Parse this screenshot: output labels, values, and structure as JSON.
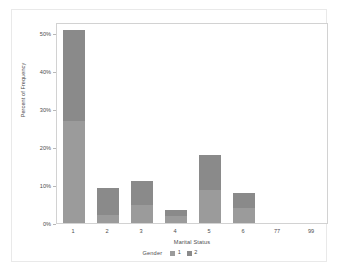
{
  "chart_data": {
    "type": "bar",
    "subtype": "stacked-percent",
    "title": "",
    "xlabel": "Marital Status",
    "ylabel": "Percent of Frequency",
    "categories": [
      "1",
      "2",
      "3",
      "4",
      "5",
      "6",
      "77",
      "99"
    ],
    "series": [
      {
        "name": "1",
        "color": "#9b9b9b",
        "values": [
          27.0,
          2.0,
          4.8,
          1.8,
          8.6,
          3.9,
          0,
          0
        ]
      },
      {
        "name": "2",
        "color": "#8a8a8a",
        "values": [
          24.0,
          7.2,
          6.2,
          1.6,
          9.4,
          4.1,
          0,
          0
        ]
      }
    ],
    "totals": [
      51.0,
      9.2,
      11.0,
      3.4,
      18.0,
      8.0,
      0,
      0
    ],
    "ylim": [
      0,
      53
    ],
    "yticks": [
      "0%",
      "10%",
      "20%",
      "30%",
      "40%",
      "50%"
    ],
    "ytick_values": [
      0,
      10,
      20,
      30,
      40,
      50
    ],
    "grid": false,
    "legend": {
      "title": "Gender",
      "position": "bottom",
      "entries": [
        {
          "label": "1",
          "color": "#9b9b9b"
        },
        {
          "label": "2",
          "color": "#8a8a8a"
        }
      ]
    }
  }
}
